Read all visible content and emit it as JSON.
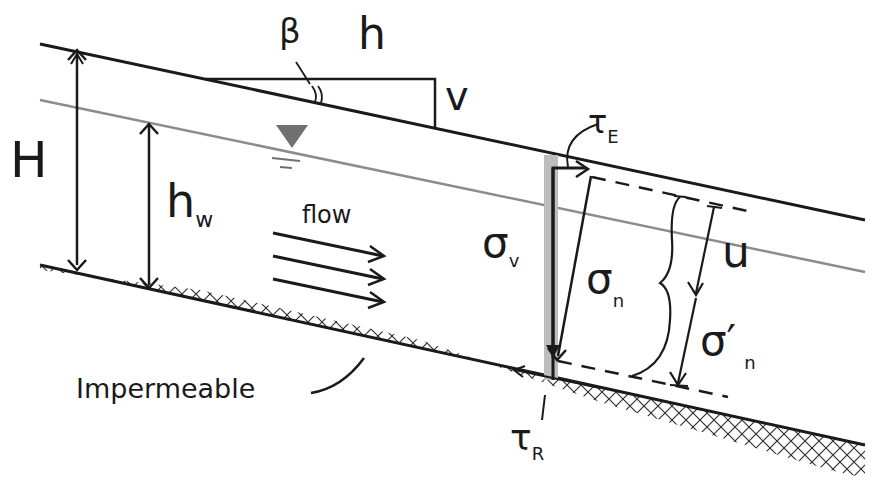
{
  "diagram": {
    "labels": {
      "beta": "β",
      "h": "h",
      "v": "v",
      "H": "H",
      "hw_main": "h",
      "hw_sub": "w",
      "flow": "flow",
      "tauE_main": "τ",
      "tauE_sub": "E",
      "sigmaV_main": "σ",
      "sigmaV_sub": "v",
      "sigmaN_main": "σ",
      "sigmaN_sub": "n",
      "u": "u",
      "sigmaNeff_main": "σ′",
      "sigmaNeff_sub": "n",
      "tauR_main": "τ",
      "tauR_sub": "R",
      "impermeable": "Impermeable"
    },
    "colors": {
      "ink": "#1a1a1a",
      "water_table": "#8c8c8c",
      "water_symbol": "#707070",
      "column": "#bdbdbd"
    }
  }
}
